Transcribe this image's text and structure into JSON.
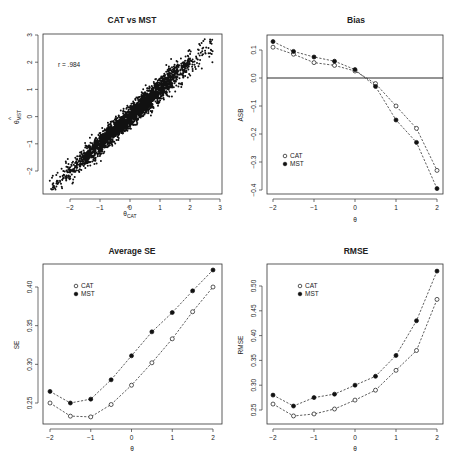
{
  "figure": {
    "panels": [
      {
        "id": "scatter",
        "title": "CAT vs MST",
        "xlabel": "θ̂_CAT",
        "ylabel": "θ̂_MST",
        "annotation": "r = .984"
      },
      {
        "id": "bias",
        "title": "Bias",
        "xlabel": "θ",
        "ylabel": "ASB",
        "legend": [
          "CAT",
          "MST"
        ]
      },
      {
        "id": "se",
        "title": "Average SE",
        "xlabel": "θ",
        "ylabel": "SE",
        "legend": [
          "CAT",
          "MST"
        ]
      },
      {
        "id": "rmse",
        "title": "RMSE",
        "xlabel": "θ",
        "ylabel": "RMSE",
        "legend": [
          "CAT",
          "MST"
        ]
      }
    ]
  },
  "chart_data": [
    {
      "type": "scatter",
      "title": "CAT vs MST",
      "xlabel": "θ̂_CAT",
      "ylabel": "θ̂_MST",
      "annotation": "r = .984",
      "xlim": [
        -2.9,
        3.1
      ],
      "ylim": [
        -3.0,
        3.0
      ],
      "xticks": [
        -2,
        -1,
        0,
        1,
        2,
        3
      ],
      "yticks": [
        -2,
        -1,
        0,
        1,
        2,
        3
      ],
      "correlation": 0.984,
      "point_cloud": {
        "x_range": [
          -2.6,
          2.8
        ],
        "y_range": [
          -2.6,
          2.8
        ],
        "description": "dense elongated cloud along y = x"
      }
    },
    {
      "type": "line",
      "title": "Bias",
      "xlabel": "θ",
      "ylabel": "ASB",
      "x": [
        -2,
        -1.5,
        -1,
        -0.5,
        0,
        0.5,
        1,
        1.5,
        2
      ],
      "xticks": [
        -2,
        -1,
        0,
        1,
        2
      ],
      "yticks": [
        -0.4,
        -0.3,
        -0.2,
        -0.1,
        0.0,
        0.1
      ],
      "ylim": [
        -0.41,
        0.145
      ],
      "reference_line": 0,
      "legend_position": "lower left",
      "series": [
        {
          "name": "CAT",
          "marker": "open-circle",
          "values": [
            0.11,
            0.085,
            0.055,
            0.045,
            0.025,
            -0.02,
            -0.1,
            -0.18,
            -0.33
          ]
        },
        {
          "name": "MST",
          "marker": "filled-circle",
          "values": [
            0.13,
            0.095,
            0.075,
            0.06,
            0.03,
            -0.03,
            -0.15,
            -0.23,
            -0.395
          ]
        }
      ]
    },
    {
      "type": "line",
      "title": "Average SE",
      "xlabel": "θ",
      "ylabel": "SE",
      "x": [
        -2,
        -1.5,
        -1,
        -0.5,
        0,
        0.5,
        1,
        1.5,
        2
      ],
      "xticks": [
        -2,
        -1,
        0,
        1,
        2
      ],
      "yticks": [
        0.25,
        0.3,
        0.35,
        0.4
      ],
      "ylim": [
        0.225,
        0.428
      ],
      "legend_position": "upper left",
      "series": [
        {
          "name": "CAT",
          "marker": "open-circle",
          "values": [
            0.25,
            0.233,
            0.232,
            0.248,
            0.273,
            0.302,
            0.333,
            0.368,
            0.4
          ]
        },
        {
          "name": "MST",
          "marker": "filled-circle",
          "values": [
            0.265,
            0.25,
            0.255,
            0.28,
            0.311,
            0.342,
            0.367,
            0.395,
            0.422
          ]
        }
      ]
    },
    {
      "type": "line",
      "title": "RMSE",
      "xlabel": "θ",
      "ylabel": "RMSE",
      "x": [
        -2,
        -1.5,
        -1,
        -0.5,
        0,
        0.5,
        1,
        1.5,
        2
      ],
      "xticks": [
        -2,
        -1,
        0,
        1,
        2
      ],
      "yticks": [
        0.25,
        0.3,
        0.35,
        0.4,
        0.45,
        0.5
      ],
      "ylim": [
        0.228,
        0.54
      ],
      "legend_position": "upper left",
      "series": [
        {
          "name": "CAT",
          "marker": "open-circle",
          "values": [
            0.262,
            0.238,
            0.242,
            0.252,
            0.27,
            0.29,
            0.33,
            0.37,
            0.473
          ]
        },
        {
          "name": "MST",
          "marker": "filled-circle",
          "values": [
            0.28,
            0.258,
            0.275,
            0.282,
            0.3,
            0.318,
            0.36,
            0.43,
            0.53
          ]
        }
      ]
    }
  ]
}
